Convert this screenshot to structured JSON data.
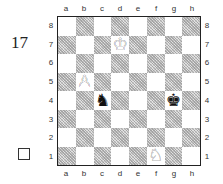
{
  "problem": {
    "number": "17",
    "checkbox_checked": false
  },
  "board": {
    "files": [
      "a",
      "b",
      "c",
      "d",
      "e",
      "f",
      "g",
      "h"
    ],
    "ranks": [
      "8",
      "7",
      "6",
      "5",
      "4",
      "3",
      "2",
      "1"
    ],
    "light_square_color": "#ffffff",
    "dark_square_color": "#c9c9c9",
    "pieces": [
      {
        "square": "d7",
        "color": "white",
        "type": "king",
        "glyph": "♔"
      },
      {
        "square": "b5",
        "color": "white",
        "type": "pawn",
        "glyph": "♙"
      },
      {
        "square": "c4",
        "color": "black",
        "type": "knight",
        "glyph": "♞"
      },
      {
        "square": "g4",
        "color": "black",
        "type": "king",
        "glyph": "♚"
      },
      {
        "square": "f1",
        "color": "white",
        "type": "knight",
        "glyph": "♘"
      }
    ]
  }
}
